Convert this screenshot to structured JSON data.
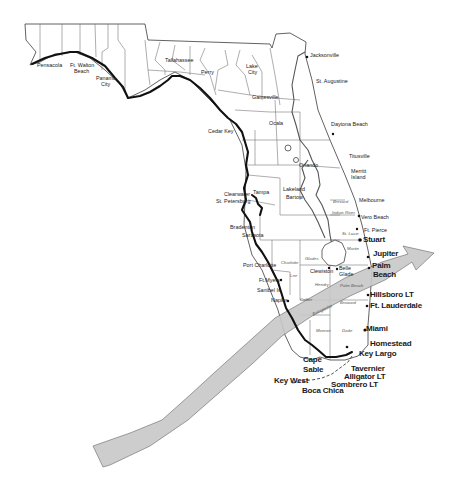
{
  "map": {
    "title": "Florida map with hurricane track band",
    "colors": {
      "background": "#ffffff",
      "coastline": "#111111",
      "county_lines": "#6a6a6a",
      "track_band": "#c8c8c8"
    },
    "cities": {
      "pensacola": "Pensacola",
      "ft_walton_1": "Ft. Walton",
      "ft_walton_2": "Beach",
      "panama_1": "Panama",
      "panama_2": "City",
      "tallahassee": "Tallahassee",
      "perry": "Perry",
      "lake_city_1": "Lake",
      "lake_city_2": "City",
      "jacksonville": "Jacksonville",
      "st_augustine": "St. Augustine",
      "gainesville": "Gainesville",
      "ocala": "Ocala",
      "cedar_key": "Cedar Key",
      "daytona": "Daytona Beach",
      "titusville": "Titusville",
      "merritt_1": "Merritt",
      "merritt_2": "Island",
      "orlando": "Orlando",
      "lakeland": "Lakeland",
      "bartow": "Bartow",
      "clearwater": "Clearwater",
      "st_petersburg": "St. Petersburg",
      "tampa": "Tampa",
      "melbourne": "Melbourne",
      "vero": "Vero Beach",
      "ft_pierce": "Ft. Pierce",
      "bradenton": "Bradenton",
      "sarasota": "Sarasota",
      "stuart": "Stuart",
      "jupiter": "Jupiter",
      "palm_1": "Palm",
      "palm_2": "Beach",
      "port_charlotte": "Port Charlotte",
      "clewiston": "Clewiston",
      "belle_1": "Belle",
      "belle_2": "Glade",
      "ft_myers": "Ft.Myers",
      "sanibel": "Sanibel Is.",
      "naples": "Naples",
      "hillsboro": "Hillsboro LT",
      "ft_lauderdale": "Ft. Lauderdale",
      "miami": "Miami",
      "homestead": "Homestead",
      "key_largo": "Key Largo",
      "cape_1": "Cape",
      "cape_2": "Sable",
      "tavernier": "Tavernier",
      "alligator": "Alligator LT",
      "sombrero": "Sombrero LT",
      "key_west": "Key West",
      "boca_chica": "Boca Chica"
    },
    "counties": {
      "brevard": "Brevard",
      "indian_river": "Indian River",
      "st_lucie": "St. Lucie",
      "martin": "Martin",
      "charlotte": "Charlotte",
      "glades": "Glades",
      "lee": "Lee",
      "hendry": "Hendry",
      "palm_beach": "Palm Beach",
      "collier": "Collier",
      "broward": "Broward",
      "everglades": "Everglades",
      "monroe": "Monroe",
      "dade": "Dade"
    }
  }
}
